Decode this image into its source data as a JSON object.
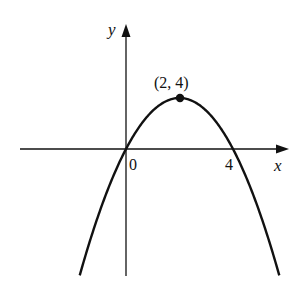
{
  "chart_data": {
    "type": "line",
    "title": "",
    "xlabel": "x",
    "ylabel": "y",
    "function": "y = -(x-2)^2 + 4",
    "x_tick_labels": [
      "0",
      "4"
    ],
    "series": [
      {
        "name": "parabola",
        "x": [
          -1.73,
          -1,
          0,
          1,
          2,
          3,
          4,
          5,
          5.73
        ],
        "y": [
          -9.9,
          -5,
          0,
          3,
          4,
          3,
          0,
          -5,
          -9.9
        ]
      }
    ],
    "annotations": [
      {
        "label": "(2, 4)",
        "x": 2,
        "y": 4,
        "marker": "filled-circle"
      }
    ],
    "xlim": [
      -4,
      6.1
    ],
    "ylim": [
      -9.9,
      9.7
    ],
    "grid": false,
    "legend": "none"
  },
  "labels": {
    "x_axis": "x",
    "y_axis": "y",
    "origin": "0",
    "root": "4",
    "vertex": "(2, 4)"
  },
  "colors": {
    "ink": "#111111",
    "background": "#ffffff"
  }
}
